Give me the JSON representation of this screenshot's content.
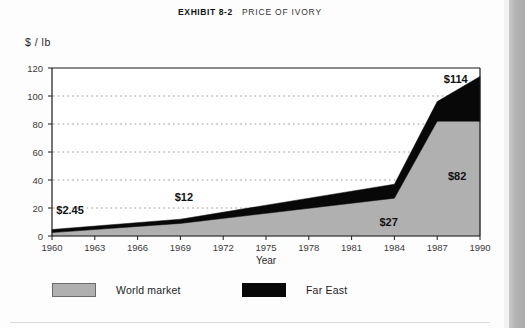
{
  "exhibit": {
    "number_label": "EXHIBIT 8-2",
    "title_label": "PRICE OF IVORY"
  },
  "chart_data": {
    "type": "area",
    "title": "PRICE OF IVORY",
    "xlabel": "Year",
    "ylabel": "$ / lb",
    "xlim": [
      1960,
      1990
    ],
    "ylim": [
      0,
      120
    ],
    "grid": true,
    "legend_position": "bottom",
    "xticks": [
      "1960",
      "1963",
      "1966",
      "1969",
      "1972",
      "1975",
      "1978",
      "1981",
      "1984",
      "1987",
      "1990"
    ],
    "yticks": [
      "0",
      "20",
      "40",
      "60",
      "80",
      "100",
      "120"
    ],
    "x": [
      1960,
      1969,
      1984,
      1987,
      1990
    ],
    "series": [
      {
        "name": "World market",
        "color": "#b0b0b0",
        "values": [
          2.45,
          9,
          27,
          82,
          82
        ]
      },
      {
        "name": "Far East",
        "color": "#080808",
        "values": [
          2.2,
          3,
          10,
          14,
          32
        ]
      }
    ],
    "totals": [
      4.65,
      12,
      37,
      96,
      114
    ],
    "annotations": [
      {
        "text": "$2.45",
        "x": 1960.3,
        "y": 16,
        "anchor": "start"
      },
      {
        "text": "$12",
        "x": 1968.6,
        "y": 25,
        "anchor": "start"
      },
      {
        "text": "$27",
        "x": 1983.6,
        "y": 7,
        "anchor": "middle"
      },
      {
        "text": "$82",
        "x": 1988.4,
        "y": 40,
        "anchor": "middle"
      },
      {
        "text": "$114",
        "x": 1988.3,
        "y": 109,
        "anchor": "middle"
      }
    ]
  },
  "legend": {
    "items": [
      {
        "label": "World market",
        "swatch": "gray"
      },
      {
        "label": "Far East",
        "swatch": "black"
      }
    ]
  },
  "axes": {
    "x_title": "Year",
    "y_unit": "$ / lb"
  },
  "colors": {
    "world_market": "#b0b0b0",
    "far_east": "#080808",
    "axis": "#1a1a1a",
    "grid": "#8c8c8c",
    "page": "#fdfdfd"
  }
}
